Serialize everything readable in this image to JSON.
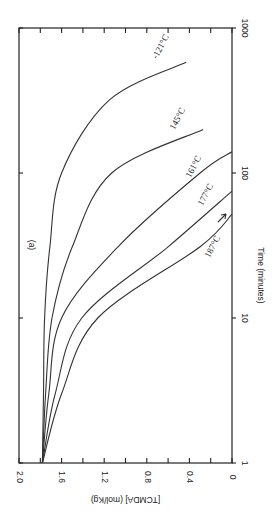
{
  "chart_data": {
    "type": "line",
    "orientation": "rotated-90",
    "panel_label": "(a)",
    "title": "",
    "xlabel": "Time (minutes)",
    "ylabel": "[TCMDA] (mol/Kg)",
    "xscale": "log",
    "xlim": [
      1,
      1000
    ],
    "ylim": [
      0,
      2.0
    ],
    "x_ticks": [
      "1",
      "10",
      "100",
      "1000"
    ],
    "y_ticks": [
      "2.0",
      "1.6",
      "1.2",
      "0.8",
      "0.4",
      "0"
    ],
    "grid": false,
    "series": [
      {
        "name": "121°C",
        "label": "-121°C",
        "x": [
          1,
          3,
          10,
          31,
          100,
          320,
          580
        ],
        "y": [
          1.78,
          1.77,
          1.76,
          1.71,
          1.6,
          1.15,
          0.43
        ]
      },
      {
        "name": "145°C",
        "label": "145°C",
        "x": [
          1,
          3,
          10,
          31,
          100,
          200
        ],
        "y": [
          1.78,
          1.75,
          1.69,
          1.5,
          1.13,
          0.27
        ]
      },
      {
        "name": "161°C",
        "label": "161°C",
        "x": [
          1,
          3,
          10,
          31,
          100,
          140
        ],
        "y": [
          1.78,
          1.72,
          1.6,
          1.07,
          0.3,
          0.0
        ]
      },
      {
        "name": "177°C",
        "label": "177°C",
        "x": [
          1,
          3,
          10,
          31,
          75
        ],
        "y": [
          1.78,
          1.66,
          1.41,
          0.6,
          0.0
        ]
      },
      {
        "name": "187°C",
        "label": "187°C",
        "x": [
          1,
          3,
          10,
          31,
          52
        ],
        "y": [
          1.78,
          1.6,
          1.26,
          0.3,
          0.0
        ]
      }
    ]
  }
}
